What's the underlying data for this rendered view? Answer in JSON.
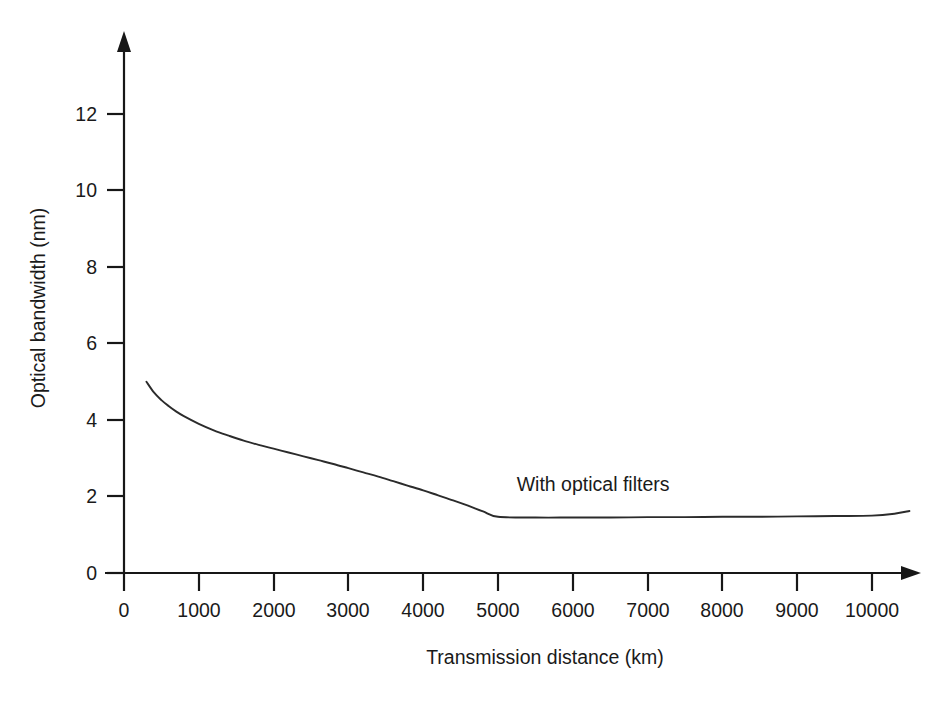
{
  "chart_data": {
    "type": "line",
    "title": "",
    "xlabel": "Transmission distance (km)",
    "ylabel": "Optical bandwidth (nm)",
    "xlim": [
      0,
      10500
    ],
    "ylim": [
      0,
      13.2
    ],
    "grid": false,
    "legend_position": "inline-annotation",
    "xticks": [
      0,
      1000,
      2000,
      3000,
      4000,
      5000,
      6000,
      7000,
      8000,
      9000,
      10000
    ],
    "xtick_labels": [
      "0",
      "1000",
      "2000",
      "3000",
      "4000",
      "5000",
      "6000",
      "7000",
      "8000",
      "9000",
      "10000"
    ],
    "yticks": [
      0,
      2,
      4,
      6,
      8,
      10,
      12
    ],
    "ytick_labels": [
      "0",
      "2",
      "4",
      "6",
      "8",
      "10",
      "12"
    ],
    "series": [
      {
        "name": "With optical filters",
        "annotation": "With optical filters",
        "annotation_x": 5250,
        "annotation_y": 2.15,
        "color": "#2b2b2b",
        "x": [
          300,
          400,
          500,
          600,
          700,
          800,
          1000,
          1200,
          1400,
          1600,
          1800,
          2000,
          2200,
          2400,
          2600,
          2800,
          3000,
          3200,
          3400,
          3600,
          3800,
          4000,
          4200,
          4400,
          4600,
          4800,
          5000,
          5500,
          6000,
          6500,
          7000,
          7500,
          8000,
          8500,
          9000,
          9500,
          10000,
          10300,
          10500
        ],
        "y": [
          5.0,
          4.72,
          4.52,
          4.36,
          4.22,
          4.1,
          3.9,
          3.73,
          3.59,
          3.46,
          3.35,
          3.25,
          3.15,
          3.05,
          2.95,
          2.85,
          2.74,
          2.63,
          2.52,
          2.4,
          2.28,
          2.16,
          2.03,
          1.9,
          1.76,
          1.61,
          1.47,
          1.45,
          1.45,
          1.45,
          1.46,
          1.46,
          1.47,
          1.47,
          1.48,
          1.49,
          1.5,
          1.55,
          1.62
        ]
      }
    ]
  },
  "axes": {
    "x_label": "Transmission distance (km)",
    "y_label": "Optical bandwidth (nm)"
  },
  "annotations": {
    "curve_label": "With optical filters"
  }
}
